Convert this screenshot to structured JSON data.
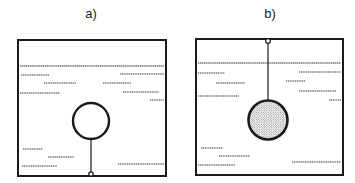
{
  "figure": {
    "panels": [
      {
        "id": "a",
        "label": "a)",
        "description": "Hollow (light) sphere submerged in liquid, tethered by a string to the bottom of the container",
        "sphere": "hollow",
        "tether": "bottom"
      },
      {
        "id": "b",
        "label": "b)",
        "description": "Dense (stippled) sphere submerged in liquid, suspended by a string from the top of the container",
        "sphere": "dense-stippled",
        "tether": "top"
      }
    ]
  },
  "colors": {
    "stroke": "#1a1a1a",
    "background": "#ffffff"
  }
}
